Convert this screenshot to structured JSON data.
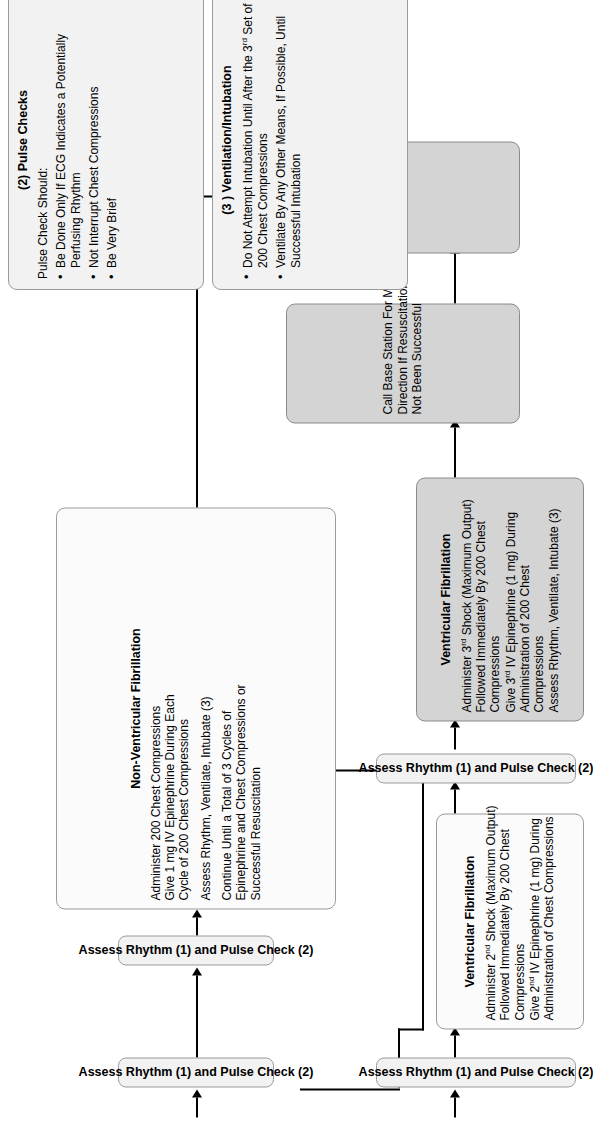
{
  "diagram": {
    "colors": {
      "box_light": "#f2f2f2",
      "box_shaded": "#d4d4d4",
      "border": "#9a9a9a",
      "connector": "#000000"
    }
  },
  "assess_bars": {
    "bar1": "Assess Rhythm (1) and Pulse Check (2)",
    "bar2": "Assess Rhythm (1) and Pulse Check (2)",
    "bar3": "Assess Rhythm (1) and Pulse Check (2)",
    "bar4": "Assess Rhythm (1) and Pulse Check (2)"
  },
  "boxes": {
    "vf2": {
      "title": "Ventricular Fibrillation",
      "lines": [
        "Administer 2nd Shock (Maximum Output)",
        "Followed Immediately By 200 Chest",
        "Compressions",
        "Give 2nd IV Epinephrine (1 mg) During",
        "Administration of Chest Compressions"
      ]
    },
    "nonvf": {
      "title": "Non-Ventricular Fibrillation",
      "lines": [
        "Administer 200 Chest Compressions",
        "Give 1 mg IV Epinephrine During Each",
        "Cycle of 200 Chest Compressions",
        "Assess Rhythm, Ventilate, Intubate (3)",
        "Continue Until a Total of 3 Cycles of",
        "Epinephrine and Chest Compressions or",
        "Successful Resuscitation"
      ]
    },
    "vf3": {
      "title": "Ventricular Fibrillation",
      "lines": [
        "Administer 3rd Shock (Maximum Output)",
        "Followed Immediately By 200 Chest",
        "Compressions",
        "Give 3rd IV Epinephrine (1 mg) During",
        "Administration of 200 Chest",
        "Compressions",
        "Assess Rhythm, Ventilate, Intubate (3)"
      ]
    },
    "call_base": {
      "title": "",
      "lines": [
        "Call Base Station For Medical",
        "Direction If Resuscitation Has",
        "Not Been Successful"
      ]
    },
    "follow_aha": {
      "title": "",
      "lines": [
        "Follow AHA Guidelines"
      ]
    }
  },
  "notes": {
    "pulse_checks": {
      "title": "(2) Pulse Checks",
      "intro": "Pulse Check Should:",
      "bullets": [
        "Be Done Only If ECG Indicates a Potentially Perfusing Rhythm",
        "Not Interrupt Chest Compressions",
        "Be Very Brief"
      ]
    },
    "ventilation": {
      "title": "(3 ) Ventilation/Intubation",
      "bullets": [
        "Do Not Attempt Intubation Until After the 3rd Set of 200 Chest Compressions",
        "Ventilate By Any Other Means, If Possible, Until Successful Intubation"
      ]
    }
  }
}
